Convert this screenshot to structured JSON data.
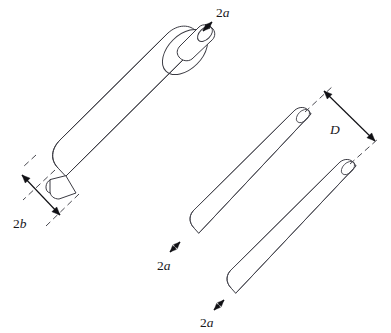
{
  "figure": {
    "background_color": "#ffffff",
    "line_color": "#3a3a42",
    "dimension_color": "#101014",
    "width": 391,
    "height": 333
  },
  "labels": {
    "stub_top": {
      "prefix": "2",
      "variable": "a",
      "x": 216,
      "y": 17
    },
    "cylinder_diameter": {
      "prefix": "2",
      "variable": "b",
      "x": 13,
      "y": 228
    },
    "rod_spacing": {
      "prefix": "",
      "variable": "D",
      "x": 330,
      "y": 134
    },
    "rod_upper_diameter": {
      "prefix": "2",
      "variable": "a",
      "x": 157,
      "y": 270
    },
    "rod_lower_diameter": {
      "prefix": "2",
      "variable": "a",
      "x": 200,
      "y": 327
    }
  },
  "shapes": {
    "big_cylinder": {
      "name": "large-cylinder",
      "axis_angle_deg": -45,
      "body_path": "M 58 168 C 50 160 51 149 60 140 L 168 33 C 178 24 190 24 197 32 L 204 39 L 66 176 Z",
      "side_line_upper": "M 60 140 L 168 33",
      "side_line_lower": "M 66 176 L 204 39",
      "end_cap_ellipse": {
        "cx": 185,
        "cy": 52,
        "rx": 27,
        "ry": 17,
        "rotate": -45
      },
      "near_end_arc": "M 58 168 C 50 160 51 149 60 140"
    },
    "big_cylinder_stub_top": {
      "name": "upper-stub",
      "body_path": "M 180 46 L 199 27 C 203 23 210 25 213 29 C 216 33 215 38 211 41 L 192 59 C 188 62 182 61 179 57 C 176 53 177 49 180 46 Z",
      "cap_ellipse": {
        "cx": 205,
        "cy": 34,
        "rx": 9,
        "ry": 5.5,
        "rotate": -45
      }
    },
    "big_cylinder_stub_bottom": {
      "name": "lower-stub",
      "body_path": "M 50 180 L 50 191 C 50 196 54 199 59 199 L 76 193 L 66 176 Z",
      "cap_arc": "M 50 180 C 45 182 44 192 50 193"
    },
    "rod_upper": {
      "name": "upper-rod",
      "body_path": "M 194 228 C 188 222 189 214 195 209 L 295 110 C 300 106 306 107 309 111 L 311 114 L 199 233 Z",
      "side_line_a": "M 195 209 L 295 110",
      "side_line_b": "M 199 233 L 311 114",
      "cap_ellipse": {
        "cx": 303,
        "cy": 116,
        "rx": 8,
        "ry": 5,
        "rotate": -45
      },
      "near_end_arc": "M 194 228 C 188 222 189 214 195 209"
    },
    "rod_lower": {
      "name": "lower-rod",
      "body_path": "M 231 288 C 225 282 226 274 232 269 L 340 162 C 345 158 351 159 354 163 L 356 166 L 236 293 Z",
      "side_line_a": "M 232 269 L 340 162",
      "side_line_b": "M 236 293 L 356 166",
      "cap_ellipse": {
        "cx": 348,
        "cy": 168,
        "rx": 8,
        "ry": 5,
        "rotate": -45
      },
      "near_end_arc": "M 231 288 C 225 282 226 274 232 269"
    }
  },
  "dimensions": {
    "stub_top": {
      "name": "stub-diameter-dimension",
      "arrow_path": "M 203 31 L 212 22",
      "arrow_head_start": {
        "x": 203,
        "y": 31,
        "angle": 135
      },
      "arrow_head_end": {
        "x": 212,
        "y": 22,
        "angle": -45
      }
    },
    "cylinder_diameter": {
      "name": "cylinder-diameter-dimension",
      "ext_line_upper": "M 55 170 L 23 200",
      "ext_line_lower": "M 79 194 L 46 226",
      "ext_line_upper_inner": "M 36 155 L 23 167",
      "arrow_path": "M 22 175 L 60 215",
      "arrow_head_start": {
        "x": 22,
        "y": 175,
        "angle": 225
      },
      "arrow_head_end": {
        "x": 60,
        "y": 215,
        "angle": 45
      }
    },
    "rod_spacing": {
      "name": "rod-spacing-dimension",
      "ext_line_top": "M 305 112 L 333 86",
      "ext_line_bottom": "M 350 164 L 378 139",
      "arrow_path": "M 324 91 L 375 141",
      "arrow_head_start": {
        "x": 324,
        "y": 91,
        "angle": 225
      },
      "arrow_head_end": {
        "x": 375,
        "y": 141,
        "angle": 45
      }
    },
    "rod_upper_diameter": {
      "name": "upper-rod-diameter-dimension",
      "arrow_path": "M 170 252 L 180 242",
      "arrow_head_start": {
        "x": 170,
        "y": 252,
        "angle": 135
      },
      "arrow_head_end": {
        "x": 180,
        "y": 242,
        "angle": -45
      }
    },
    "rod_lower_diameter": {
      "name": "lower-rod-diameter-dimension",
      "arrow_path": "M 214 310 L 224 300",
      "arrow_head_start": {
        "x": 214,
        "y": 310,
        "angle": 135
      },
      "arrow_head_end": {
        "x": 224,
        "y": 300,
        "angle": -45
      }
    }
  }
}
